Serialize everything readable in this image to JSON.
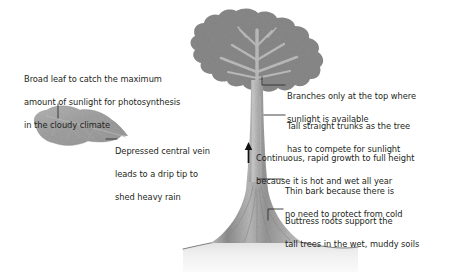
{
  "diagram": {
    "background_color": "#ffffff",
    "text_color": "#231f20",
    "canopy_color": "#8a8a8a",
    "branch_color": "#b8b8b8",
    "trunk_color": "#b0b0b0",
    "leaf_color": "#a6a6a6",
    "ground_color": "#e9e9e9",
    "leader_color": "#3a3a3a"
  },
  "annotations": {
    "broad_leaf": {
      "id": "broad-leaf",
      "lines": [
        "Broad leaf to catch the maximum",
        "amount of sunlight for photosynthesis",
        "in the cloudy climate"
      ]
    },
    "central_vein": {
      "id": "central-vein",
      "lines": [
        "Depressed central vein",
        "leads to a drip tip to",
        "shed heavy rain"
      ]
    },
    "branches": {
      "id": "branches",
      "lines": [
        "Branches only at the top where",
        "sunlight is available"
      ]
    },
    "tall_trunks": {
      "id": "tall-trunks",
      "lines": [
        "Tall straight trunks as the tree",
        "has to compete for sunlight"
      ]
    },
    "rapid_growth": {
      "id": "rapid-growth",
      "lines": [
        "Continuous, rapid growth to full height",
        "because it is hot and wet all year"
      ]
    },
    "thin_bark": {
      "id": "thin-bark",
      "lines": [
        "Thin bark because there is",
        "no need to protect from cold"
      ]
    },
    "buttress_roots": {
      "id": "buttress-roots",
      "lines": [
        "Buttress roots support the",
        "tall trees in the wet, muddy soils"
      ]
    }
  },
  "icons": {
    "growth_arrow": "up-arrow-icon",
    "canopy": "tree-canopy-shape",
    "trunk": "tree-trunk-shape",
    "leaf": "broad-leaf-shape",
    "ground": "ground-line-shape"
  }
}
